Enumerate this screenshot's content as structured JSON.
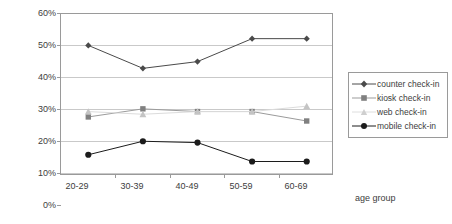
{
  "chart_data": {
    "type": "line",
    "title": "",
    "xlabel": "age group",
    "ylabel": "",
    "categories": [
      "20-29",
      "30-39",
      "40-49",
      "50-59",
      "60-69"
    ],
    "ylim": [
      0,
      60
    ],
    "ytick_labels": [
      "0%",
      "10%",
      "20%",
      "30%",
      "40%",
      "50%",
      "60%"
    ],
    "ytick_values": [
      0,
      10,
      20,
      30,
      40,
      50,
      60
    ],
    "grid": true,
    "legend_position": "right",
    "series": [
      {
        "name": "counter check-in",
        "marker": "diamond",
        "color": "#4a4a4a",
        "values": [
          48,
          39.5,
          42,
          50.5,
          50.5
        ]
      },
      {
        "name": "kiosk check-in",
        "marker": "square",
        "color": "#808080",
        "values": [
          21.5,
          24.5,
          23.5,
          23.5,
          20
        ]
      },
      {
        "name": "web check-in",
        "marker": "triangle",
        "color": "#c4c4c4",
        "values": [
          23.5,
          22.5,
          23.5,
          23.5,
          25.5
        ]
      },
      {
        "name": "mobile check-in",
        "marker": "circle",
        "color": "#1c1c1c",
        "values": [
          7.5,
          12.5,
          12,
          5,
          5
        ]
      }
    ]
  },
  "axes": {
    "y_labels": [
      "60%",
      "50%",
      "40%",
      "30%",
      "20%",
      "10%",
      "0%"
    ],
    "x_labels": [
      "20-29",
      "30-39",
      "40-49",
      "50-59",
      "60-69"
    ],
    "x_axis_title": "age group"
  },
  "legend": {
    "items": [
      {
        "label": "counter check-in"
      },
      {
        "label": "kiosk check-in"
      },
      {
        "label": "web check-in"
      },
      {
        "label": "mobile check-in"
      }
    ]
  }
}
